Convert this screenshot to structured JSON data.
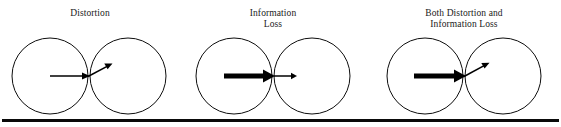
{
  "figure": {
    "width": 561,
    "height": 127,
    "background_color": "#ffffff",
    "ink_color": "#000000"
  },
  "baseline": {
    "name": "bottom-rule",
    "y": 119,
    "x_start": 2,
    "x_end": 559,
    "thickness": 3,
    "color": "#0a0a0a"
  },
  "panels": [
    {
      "id": "distortion",
      "caption_lines": [
        "Distortion"
      ],
      "caption_center_x": 90,
      "caption_line1_y": 16,
      "caption_line2_y": 27,
      "left_circle": {
        "cx": 50,
        "cy": 76,
        "r": 38
      },
      "right_circle": {
        "cx": 128,
        "cy": 76,
        "r": 38
      },
      "arrow": {
        "type": "bent-same-weight",
        "incoming_weight": "thin",
        "outgoing_weight": "thin",
        "start_x": 50,
        "start_y": 76,
        "bend_x": 89,
        "bend_y": 76,
        "end_x": 112,
        "end_y": 64,
        "description": "A thin arrow travels to the boundary then deflects upward, keeping its thickness but changing direction."
      }
    },
    {
      "id": "information-loss",
      "caption_lines": [
        "Information",
        "Loss"
      ],
      "caption_center_x": 273,
      "caption_line1_y": 16,
      "caption_line2_y": 27,
      "left_circle": {
        "cx": 234,
        "cy": 76,
        "r": 38
      },
      "right_circle": {
        "cx": 312,
        "cy": 76,
        "r": 38
      },
      "arrow": {
        "type": "straight-thinning",
        "incoming_weight": "thick",
        "outgoing_weight": "thin",
        "start_x": 224,
        "start_y": 76,
        "bend_x": 273,
        "bend_y": 76,
        "end_x": 297,
        "end_y": 76,
        "description": "A thick arrow travels to the boundary then continues straight on as a much thinner arrow."
      }
    },
    {
      "id": "both-distortion-and-information-loss",
      "caption_lines": [
        "Both Distortion and",
        "Information Loss"
      ],
      "caption_center_x": 464,
      "caption_line1_y": 16,
      "caption_line2_y": 27,
      "left_circle": {
        "cx": 425,
        "cy": 76,
        "r": 38
      },
      "right_circle": {
        "cx": 503,
        "cy": 76,
        "r": 38
      },
      "arrow": {
        "type": "bent-thinning",
        "incoming_weight": "thick",
        "outgoing_weight": "thin",
        "start_x": 414,
        "start_y": 76,
        "bend_x": 464,
        "bend_y": 76,
        "end_x": 489,
        "end_y": 63,
        "description": "A thick arrow travels to the boundary then both deflects upward and continues as a much thinner arrow."
      }
    }
  ]
}
